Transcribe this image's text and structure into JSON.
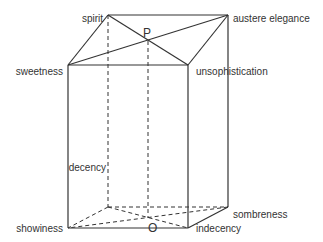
{
  "diagram": {
    "type": "cube-semantic-space",
    "vertices": {
      "spirit": {
        "label": "spirit",
        "x": 108,
        "y": 15
      },
      "austere_elegance": {
        "label": "austere elegance",
        "x": 228,
        "y": 15
      },
      "sweetness": {
        "label": "sweetness",
        "x": 68,
        "y": 65
      },
      "unsophistication": {
        "label": "unsophistication",
        "x": 188,
        "y": 65
      },
      "decency": {
        "label": "decency",
        "x": 108,
        "y": 207
      },
      "sombreness": {
        "label": "sombreness",
        "x": 228,
        "y": 207
      },
      "showiness": {
        "label": "showiness",
        "x": 68,
        "y": 228
      },
      "indecency": {
        "label": "indecency",
        "x": 188,
        "y": 228
      }
    },
    "points": {
      "P": {
        "label": "P",
        "x": 148,
        "y": 41
      },
      "O": {
        "label": "O",
        "x": 148,
        "y": 203
      }
    },
    "colors": {
      "line": "#333333",
      "text": "#333333",
      "background": "#ffffff"
    }
  }
}
